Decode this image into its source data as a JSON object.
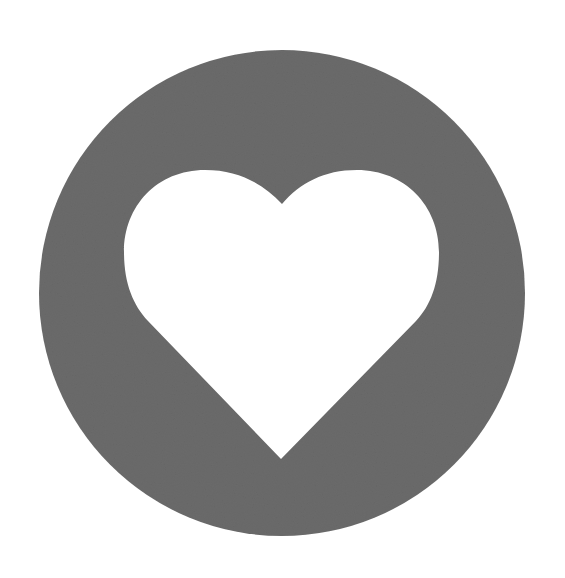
{
  "icon": {
    "name": "heart-in-circle",
    "semantic": "heart-icon",
    "colors": {
      "circle_fill": "#6b6b6b",
      "heart_fill": "#ffffff",
      "background": "#ffffff"
    },
    "geometry": {
      "circle": {
        "cx": 282,
        "cy": 293,
        "r": 243
      },
      "heart": {
        "notch": [
          282,
          204
        ],
        "bottom_point": [
          281,
          459
        ],
        "left_extent": 124,
        "right_extent": 439,
        "lobe_top_y": 170
      }
    }
  }
}
